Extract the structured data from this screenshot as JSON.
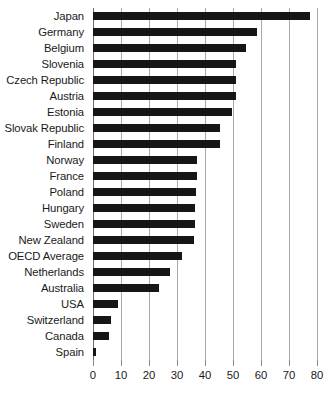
{
  "chart_data": {
    "type": "bar",
    "orientation": "horizontal",
    "title": "",
    "subtitle": "",
    "xlabel": "",
    "ylabel": "",
    "xlim": [
      0,
      80
    ],
    "grid": true,
    "legend": false,
    "legend_position": "none",
    "xticks": [
      0,
      10,
      20,
      30,
      40,
      50,
      60,
      70,
      80
    ],
    "xtick_labels": [
      "0",
      "10",
      "20",
      "30",
      "40",
      "50",
      "60",
      "70",
      "80"
    ],
    "bar_color": "#161616",
    "grid_color": "#a8a8a8",
    "categories": [
      "Japan",
      "Germany",
      "Belgium",
      "Slovenia",
      "Czech Republic",
      "Austria",
      "Estonia",
      "Slovak Republic",
      "Finland",
      "Norway",
      "France",
      "Poland",
      "Hungary",
      "Sweden",
      "New Zealand",
      "OECD Average",
      "Netherlands",
      "Australia",
      "USA",
      "Switzerland",
      "Canada",
      "Spain"
    ],
    "values": [
      77.5,
      58.5,
      54.5,
      51.0,
      51.0,
      51.0,
      49.5,
      45.5,
      45.5,
      37.0,
      37.0,
      36.8,
      36.3,
      36.3,
      36.0,
      31.8,
      27.5,
      23.5,
      9.0,
      6.5,
      5.7,
      1.0
    ]
  }
}
